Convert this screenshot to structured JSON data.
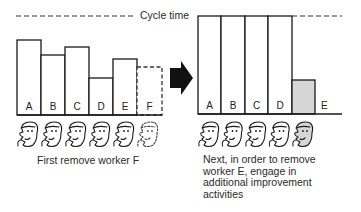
{
  "cycle_time_label": "Cycle time",
  "left_panel": {
    "caption": "First remove worker F",
    "bars": [
      {
        "label": "A",
        "top": 40,
        "x0": 17,
        "x1": 41,
        "style": "solid"
      },
      {
        "label": "B",
        "top": 55,
        "x0": 41,
        "x1": 65,
        "style": "solid"
      },
      {
        "label": "C",
        "top": 47,
        "x0": 65,
        "x1": 89,
        "style": "solid"
      },
      {
        "label": "D",
        "top": 78,
        "x0": 89,
        "x1": 113,
        "style": "solid"
      },
      {
        "label": "E",
        "top": 59,
        "x0": 113,
        "x1": 137,
        "style": "solid"
      },
      {
        "label": "F",
        "top": 67,
        "x0": 137,
        "x1": 162,
        "style": "dashed"
      }
    ],
    "workers": [
      {
        "id": "A",
        "style": "solid"
      },
      {
        "id": "B",
        "style": "solid"
      },
      {
        "id": "C",
        "style": "solid"
      },
      {
        "id": "D",
        "style": "solid"
      },
      {
        "id": "E",
        "style": "solid"
      },
      {
        "id": "F",
        "style": "dashed"
      }
    ]
  },
  "right_panel": {
    "caption_lines": [
      "Next, in order to remove",
      "worker E, engage in",
      "additional improvement",
      "activities"
    ],
    "bars": [
      {
        "label": "A",
        "top": 16,
        "x0": 198,
        "x1": 221,
        "style": "solid"
      },
      {
        "label": "B",
        "top": 16,
        "x0": 221,
        "x1": 245,
        "style": "solid"
      },
      {
        "label": "C",
        "top": 16,
        "x0": 245,
        "x1": 268,
        "style": "solid"
      },
      {
        "label": "D",
        "top": 16,
        "x0": 268,
        "x1": 292,
        "style": "solid"
      },
      {
        "label": "E",
        "top": 80,
        "x0": 292,
        "x1": 315,
        "style": "shaded"
      }
    ],
    "workers": [
      {
        "id": "A",
        "style": "solid"
      },
      {
        "id": "B",
        "style": "solid"
      },
      {
        "id": "C",
        "style": "solid"
      },
      {
        "id": "D",
        "style": "solid"
      },
      {
        "id": "E",
        "style": "shaded"
      }
    ]
  },
  "arrow_icon": "right-arrow-icon",
  "colors": {
    "line": "#1a1a1a",
    "shade": "#d6d6d6",
    "dash": "#333333"
  }
}
